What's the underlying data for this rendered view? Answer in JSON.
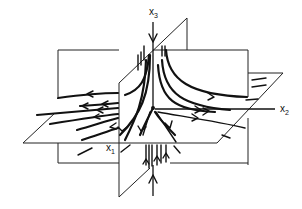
{
  "figure": {
    "axes": {
      "x1": {
        "label": "x",
        "subscript": "1"
      },
      "x2": {
        "label": "x",
        "subscript": "2"
      },
      "x3": {
        "label": "x",
        "subscript": "3"
      }
    },
    "planes": [
      "x1-x3 plane (back, vertical)",
      "x2-x3 plane (diagonal, vertical)",
      "x1-x2 plane (horizontal)"
    ],
    "colors": {
      "ink": "#111111",
      "background": "#ffffff"
    }
  }
}
